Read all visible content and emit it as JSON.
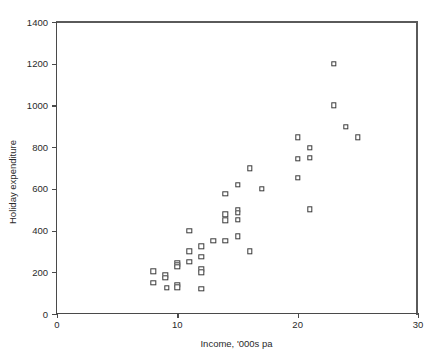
{
  "chart_data": {
    "type": "scatter",
    "title": "",
    "xlabel": "Income, '000s pa",
    "ylabel": "Holiday expenditure",
    "xlim": [
      0,
      30
    ],
    "ylim": [
      0,
      1400
    ],
    "xticks": [
      0,
      10,
      20,
      30
    ],
    "yticks": [
      0,
      200,
      400,
      600,
      800,
      1000,
      1200,
      1400
    ],
    "xtick_labels": [
      "0",
      "10",
      "20",
      "30"
    ],
    "ytick_labels": [
      "0",
      "200",
      "400",
      "600",
      "800",
      "1000",
      "1200",
      "1400"
    ],
    "grid": false,
    "legend": null,
    "marker": "open-square",
    "marker_color": "#3a3a3a",
    "frame_color": "#4a4a4a",
    "points": [
      {
        "x": 8.0,
        "y": 205
      },
      {
        "x": 8.0,
        "y": 150
      },
      {
        "x": 9.0,
        "y": 185
      },
      {
        "x": 9.0,
        "y": 175
      },
      {
        "x": 9.1,
        "y": 125
      },
      {
        "x": 10.0,
        "y": 245
      },
      {
        "x": 10.0,
        "y": 235
      },
      {
        "x": 10.0,
        "y": 225
      },
      {
        "x": 10.0,
        "y": 140
      },
      {
        "x": 10.0,
        "y": 128
      },
      {
        "x": 11.0,
        "y": 400
      },
      {
        "x": 11.0,
        "y": 300
      },
      {
        "x": 11.0,
        "y": 250
      },
      {
        "x": 12.0,
        "y": 325
      },
      {
        "x": 12.0,
        "y": 275
      },
      {
        "x": 12.0,
        "y": 215
      },
      {
        "x": 12.0,
        "y": 200
      },
      {
        "x": 12.0,
        "y": 122
      },
      {
        "x": 13.0,
        "y": 350
      },
      {
        "x": 14.0,
        "y": 575
      },
      {
        "x": 14.0,
        "y": 478
      },
      {
        "x": 14.0,
        "y": 450
      },
      {
        "x": 14.0,
        "y": 350
      },
      {
        "x": 15.0,
        "y": 618
      },
      {
        "x": 15.0,
        "y": 500
      },
      {
        "x": 15.0,
        "y": 485
      },
      {
        "x": 15.0,
        "y": 452
      },
      {
        "x": 15.0,
        "y": 372
      },
      {
        "x": 16.0,
        "y": 698
      },
      {
        "x": 16.0,
        "y": 300
      },
      {
        "x": 17.0,
        "y": 600
      },
      {
        "x": 20.0,
        "y": 848
      },
      {
        "x": 20.0,
        "y": 745
      },
      {
        "x": 20.0,
        "y": 652
      },
      {
        "x": 21.0,
        "y": 798
      },
      {
        "x": 21.0,
        "y": 748
      },
      {
        "x": 21.0,
        "y": 502
      },
      {
        "x": 23.0,
        "y": 1200
      },
      {
        "x": 23.0,
        "y": 1000
      },
      {
        "x": 24.0,
        "y": 898
      },
      {
        "x": 25.0,
        "y": 848
      }
    ]
  }
}
